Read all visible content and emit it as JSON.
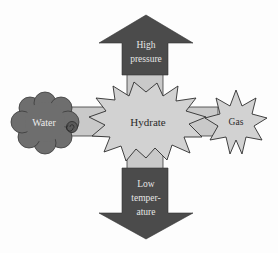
{
  "diagram": {
    "nodes": {
      "water": {
        "label": "Water"
      },
      "hydrate": {
        "label": "Hydrate"
      },
      "gas": {
        "label": "Gas"
      }
    },
    "arrows": {
      "up": {
        "line1": "High",
        "line2": "pressure"
      },
      "down": {
        "line1": "Low",
        "line2": "temper-",
        "line3": "ature"
      }
    },
    "colors": {
      "dark": "#4b4b4b",
      "light": "#c9c9c9",
      "star": "#cfcfcf",
      "cloud": "#6e6e6e",
      "outline": "#3a3a3a",
      "arrow_text": "#e6e6e6",
      "node_text_dark": "#2a2a2a",
      "node_text_light": "#ececec"
    }
  }
}
